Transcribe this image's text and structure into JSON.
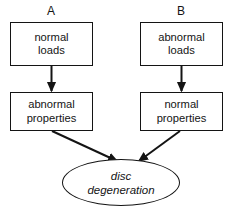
{
  "diagram": {
    "type": "flowchart",
    "background_color": "#ffffff",
    "stroke_color": "#141414",
    "text_color": "#141414",
    "columns": [
      {
        "label": "A",
        "top_node": "normal\nloads",
        "bottom_node": "abnormal\nproperties"
      },
      {
        "label": "B",
        "top_node": "abnormal\nloads",
        "bottom_node": "normal\nproperties"
      }
    ],
    "outcome": {
      "shape": "ellipse",
      "text": "disc\ndegeneration",
      "style": "italic"
    },
    "edges": [
      {
        "from": "normal loads",
        "to": "abnormal properties",
        "kind": "vertical-arrow"
      },
      {
        "from": "abnormal loads",
        "to": "normal properties",
        "kind": "vertical-arrow"
      },
      {
        "from": "abnormal properties",
        "to": "disc degeneration",
        "kind": "diagonal-arrow"
      },
      {
        "from": "normal properties",
        "to": "disc degeneration",
        "kind": "diagonal-arrow"
      }
    ]
  }
}
